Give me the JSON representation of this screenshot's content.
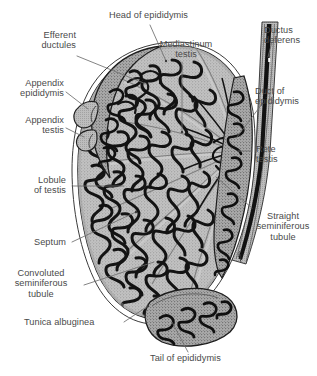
{
  "figure": {
    "background_color": "#ffffff",
    "label_color": "#4a4a4a",
    "leader_color": "#6e6e6e",
    "ink_color": "#1a1a1a",
    "parenchyma_color": "#b4b4b4",
    "width": 317,
    "height": 376
  },
  "labels": {
    "head_of_epididymis": "Head of epididymis",
    "efferent_ductules": "Efferent\nductules",
    "appendix_epididymis": "Appendix\nepididymis",
    "appendix_testis": "Appendix\ntestis",
    "mediastinum_testis": "Mediastinum\ntestis",
    "ductus_deferens": "Ductus\ndeferens",
    "duct_of_epididymis": "Duct of\nepididymis",
    "rete_testis": "Rete\ntestis",
    "straight_seminiferous_tubule": "Straight\nseminiferous\ntubule",
    "lobule_of_testis": "Lobule\nof testis",
    "septum": "Septum",
    "convoluted_seminiferous_tubule": "Convoluted\nseminiferous\ntubule",
    "tunica_albuginea": "Tunica albuginea",
    "tail_of_epididymis": "Tail of epididymis"
  },
  "structures": [
    {
      "name": "testis-body",
      "description": "Large ovoid organ occupying the centre of the field, sectioned to expose lobules"
    },
    {
      "name": "tunica-albuginea",
      "description": "Dense fibrous capsule forming the outer rim of the testis"
    },
    {
      "name": "mediastinum-testis",
      "description": "Thickened posterior ridge of the capsule projecting into the gland"
    },
    {
      "name": "rete-testis",
      "description": "Anastomosing channel network at the mediastinum"
    },
    {
      "name": "septa",
      "description": "Fibrous partitions radiating from the mediastinum dividing the gland into lobules"
    },
    {
      "name": "seminiferous-tubules",
      "description": "Heavy convoluted cords filling each lobule"
    },
    {
      "name": "head-of-epididymis",
      "description": "Superior expanded portion capping the testis"
    },
    {
      "name": "efferent-ductules",
      "description": "Coiled ducts linking rete testis to duct of epididymis"
    },
    {
      "name": "duct-of-epididymis",
      "description": "Single long coiled duct descending along the posterior border"
    },
    {
      "name": "tail-of-epididymis",
      "description": "Inferior lobe continuous with the ductus deferens"
    },
    {
      "name": "ductus-deferens",
      "description": "Thick-walled muscular tube ascending at the right margin"
    },
    {
      "name": "appendix-epididymis",
      "description": "Small pedunculated vesicle on the head of the epididymis"
    },
    {
      "name": "appendix-testis",
      "description": "Small sessile nodule on the upper pole of the testis"
    }
  ]
}
